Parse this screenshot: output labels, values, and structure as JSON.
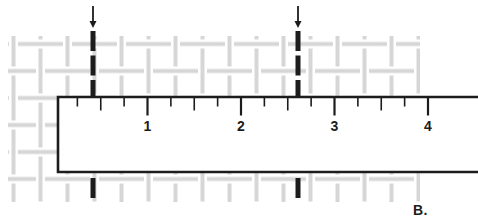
{
  "figure": {
    "label": "B.",
    "colors": {
      "background": "#ffffff",
      "ink": "#1c1c1c",
      "mesh": "#d6d6d6",
      "ruler_fill": "#ffffff"
    },
    "mesh": {
      "x": 8,
      "y": 36,
      "width": 412,
      "height": 166,
      "pitch": 27,
      "strand_width": 4,
      "cross_gap": 4.5,
      "offset_x": 0,
      "offset_y": 30.5
    },
    "ruler": {
      "left": 58,
      "top": 97,
      "bottom": 172,
      "right_open": 479,
      "edge_stroke_width": 2.6,
      "zero_x": 54,
      "pixels_per_unit": 93.5,
      "tick_min": 0.25,
      "tick_max": 4,
      "tick_step": 0.25,
      "tick_length_quarter": 8.5,
      "tick_length_half": 12.5,
      "tick_length_whole": 17.5,
      "tick_width_minor": 1.6,
      "tick_width_major": 2.2,
      "number_labels": [
        "1",
        "2",
        "3",
        "4"
      ],
      "number_baseline_y": 131,
      "number_font_size": 14
    },
    "pointers": {
      "xs": [
        93,
        298
      ],
      "arrow_top": 6,
      "arrow_tip": 28,
      "arrow_half_width": 3.5,
      "shaft_width": 1.8,
      "dash_top": 31,
      "dash_bottom": 96,
      "dash_pattern": "20 4.5",
      "below_dash_top": 178,
      "below_dash_bottom": 198,
      "dash_stroke_width": 5
    }
  }
}
